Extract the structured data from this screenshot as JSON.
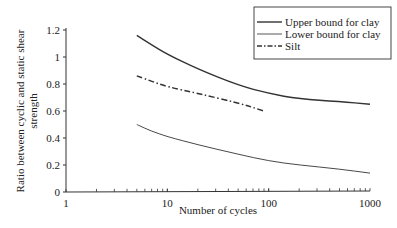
{
  "chart_data": {
    "type": "line",
    "title": "",
    "xlabel": "Number of cycles",
    "ylabel": "Ratio between cyclic and static shear strength",
    "ylabel_lines": [
      "Ratio between cyclic and static shear",
      "strength"
    ],
    "xscale": "log",
    "xlim": [
      1,
      1000
    ],
    "ylim": [
      0,
      1.2
    ],
    "x_ticks": [
      "1",
      "10",
      "100",
      "1000"
    ],
    "y_ticks": [
      "0",
      "0.2",
      "0.4",
      "0.6",
      "0.8",
      "1",
      "1.2"
    ],
    "grid": false,
    "legend_position": "top-right",
    "series": [
      {
        "name": "Upper bound for clay",
        "style": "solid",
        "stroke_width": 1.4,
        "x": [
          5,
          7,
          10,
          20,
          50,
          100,
          200,
          500,
          1000
        ],
        "y": [
          1.16,
          1.09,
          1.02,
          0.91,
          0.79,
          0.73,
          0.69,
          0.67,
          0.65
        ]
      },
      {
        "name": "Lower bound for clay",
        "style": "solid",
        "stroke_width": 0.9,
        "x": [
          5,
          7,
          10,
          20,
          50,
          100,
          200,
          500,
          1000
        ],
        "y": [
          0.5,
          0.45,
          0.41,
          0.35,
          0.28,
          0.23,
          0.2,
          0.17,
          0.14
        ]
      },
      {
        "name": "Silt",
        "style": "dash-dot",
        "stroke_width": 1.5,
        "x": [
          5,
          7,
          10,
          20,
          50,
          90
        ],
        "y": [
          0.86,
          0.82,
          0.78,
          0.73,
          0.66,
          0.6
        ]
      }
    ]
  },
  "legend": {
    "items": [
      "Upper bound for clay",
      "Lower bound for clay",
      "Silt"
    ]
  }
}
